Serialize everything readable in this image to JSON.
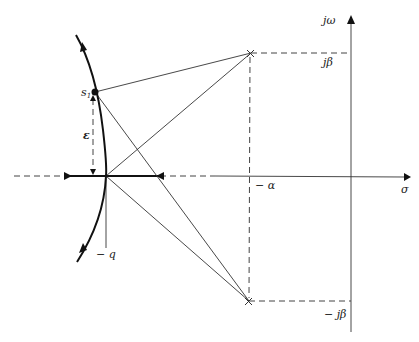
{
  "diagram": {
    "type": "root-locus (s-plane)",
    "axes": {
      "real_axis_label": "σ",
      "imag_axis_label": "jω"
    },
    "labels": {
      "upper_pole": "jβ",
      "lower_pole": "− jβ",
      "pole_real_part": "− α",
      "breakaway_point": "− q",
      "test_point": "s₁",
      "offset": "ε"
    },
    "poles": [
      {
        "name": "upper-pole",
        "real": "-α",
        "imag": "+β",
        "marker": "×"
      },
      {
        "name": "lower-pole",
        "real": "-α",
        "imag": "-β",
        "marker": "×"
      }
    ],
    "colors": {
      "line": "#333333",
      "locus": "#111111",
      "background": "#ffffff"
    }
  }
}
